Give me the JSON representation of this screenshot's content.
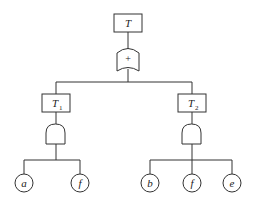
{
  "diagram": {
    "type": "fault-tree",
    "top_event": {
      "label": "T",
      "gate": "or",
      "gate_symbol": "+"
    },
    "intermediate_events": [
      {
        "label": "T",
        "subscript": "1",
        "gate": "and",
        "children": [
          "a",
          "f"
        ]
      },
      {
        "label": "T",
        "subscript": "2",
        "gate": "and",
        "children": [
          "b",
          "f",
          "e"
        ]
      }
    ],
    "basic_events": {
      "left": [
        {
          "label": "a"
        },
        {
          "label": "f"
        }
      ],
      "right": [
        {
          "label": "b"
        },
        {
          "label": "f"
        },
        {
          "label": "e"
        }
      ]
    },
    "colors": {
      "stroke": "#333333",
      "background": "#ffffff"
    }
  }
}
